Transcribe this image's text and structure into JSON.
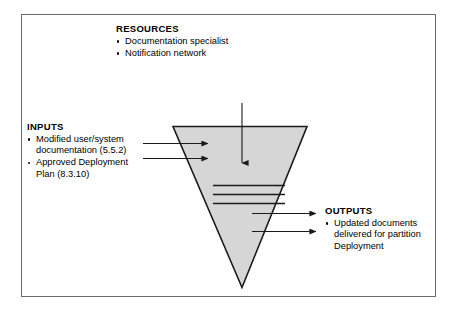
{
  "diagram": {
    "shape_name": "inverted-triangle-process",
    "fill_color": "#d6d6d6",
    "outline_color": "#1a1a1a",
    "frame_color": "#6b6b6b",
    "background_color": "#ffffff"
  },
  "resources": {
    "heading": "RESOURCES",
    "items": [
      "Documentation specialist",
      "Notification network"
    ]
  },
  "inputs": {
    "heading": "INPUTS",
    "items": [
      "Modified user/system documentation (5.5.2)",
      "Approved Deployment Plan (8.3.10)"
    ]
  },
  "outputs": {
    "heading": "OUTPUTS",
    "items": [
      "Updated documents delivered for partition Deployment"
    ]
  },
  "arrows": {
    "resource_arrow": "resource-down-arrow",
    "input_arrows": [
      "input-arrow-1",
      "input-arrow-2"
    ],
    "output_arrows": [
      "output-arrow-1",
      "output-arrow-2"
    ]
  }
}
